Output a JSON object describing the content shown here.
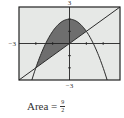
{
  "chart_data": {
    "type": "area",
    "title": "",
    "xlabel": "",
    "ylabel": "",
    "xlim": [
      -3,
      3
    ],
    "ylim": [
      -3,
      3
    ],
    "grid": false,
    "tick_labels": {
      "top": "3",
      "bottom": "−3",
      "left": "−3"
    },
    "series": [
      {
        "name": "parabola",
        "equation": "y = 2 − x^2",
        "kind": "curve"
      },
      {
        "name": "line",
        "equation": "y = x",
        "kind": "line"
      }
    ],
    "shaded_region": {
      "between": [
        "y = 2 − x^2",
        "y = x"
      ],
      "x_from": -2,
      "x_to": 1
    },
    "intersections": [
      [
        -2,
        -2
      ],
      [
        1,
        1
      ]
    ],
    "annotation": {
      "text": "Area =",
      "numerator": "9",
      "denominator": "2"
    }
  },
  "colors": {
    "plot_background": "#e6e8e6",
    "shade": "#6e6e6e",
    "curve": "#2a2a2a",
    "frame": "#222222"
  }
}
